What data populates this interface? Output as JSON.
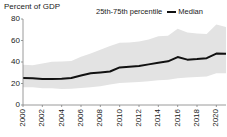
{
  "chart_data": {
    "type": "area",
    "title": "",
    "ylabel": "Percent of GDP",
    "xlabel": "",
    "ylim": [
      0,
      80
    ],
    "xlim": [
      2000,
      2021
    ],
    "grid": false,
    "legend_position": "top-right",
    "yticks": [
      80,
      60,
      40,
      20,
      0
    ],
    "xticks": [
      2000,
      2002,
      2004,
      2006,
      2008,
      2010,
      2012,
      2014,
      2016,
      2018,
      2020
    ],
    "x": [
      2000,
      2001,
      2002,
      2003,
      2004,
      2005,
      2006,
      2007,
      2008,
      2009,
      2010,
      2011,
      2012,
      2013,
      2014,
      2015,
      2016,
      2017,
      2018,
      2019,
      2020,
      2021
    ],
    "series": [
      {
        "name": "Median",
        "type": "line",
        "color": "#111111",
        "values": [
          25.2,
          25.0,
          24.2,
          24.3,
          24.5,
          25.2,
          27.4,
          29.5,
          30.3,
          31.2,
          35.0,
          35.6,
          36.2,
          37.8,
          39.3,
          40.6,
          44.6,
          42.2,
          42.8,
          43.6,
          47.8,
          47.6
        ]
      },
      {
        "name": "25th-75th percentile",
        "type": "band",
        "color": "#e3e3e3",
        "upper": [
          37.5,
          37.0,
          38.5,
          40.2,
          40.4,
          41.0,
          44.8,
          48.0,
          51.5,
          55.0,
          58.0,
          58.2,
          59.0,
          61.0,
          64.0,
          64.5,
          71.0,
          67.5,
          66.5,
          66.0,
          75.0,
          72.5
        ],
        "lower": [
          16.5,
          16.5,
          15.5,
          15.5,
          15.0,
          15.2,
          15.8,
          16.6,
          17.5,
          19.0,
          20.5,
          21.0,
          21.5,
          22.0,
          23.0,
          23.5,
          25.0,
          25.5,
          26.0,
          26.5,
          29.5,
          29.5
        ]
      }
    ],
    "legend_entries": [
      {
        "label": "25th-75th percentile",
        "marker": "band",
        "color": "#e3e3e3"
      },
      {
        "label": "Median",
        "marker": "line",
        "color": "#111111"
      }
    ]
  }
}
